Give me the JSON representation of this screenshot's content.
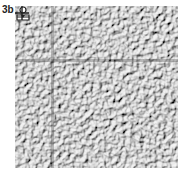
{
  "figure": {
    "panel_label": "3b",
    "markers": [
      {
        "type": "person-icon"
      },
      {
        "type": "crosshair-icon"
      }
    ],
    "colors": {
      "texture_light": "#f2f2f2",
      "texture_dark": "#6e6e6e",
      "marker": "#222222"
    }
  }
}
